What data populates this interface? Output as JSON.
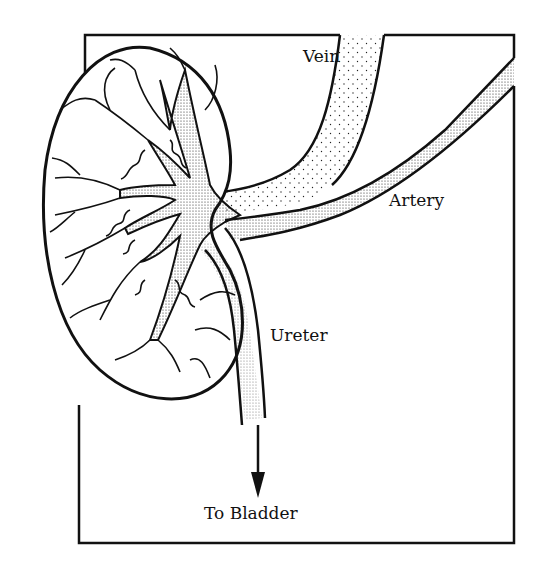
{
  "diagram": {
    "labels": {
      "vein": "Vein",
      "artery": "Artery",
      "ureter": "Ureter",
      "to_bladder": "To Bladder"
    },
    "colors": {
      "line": "#111111",
      "background": "#ffffff",
      "stipple": "#222222"
    }
  }
}
